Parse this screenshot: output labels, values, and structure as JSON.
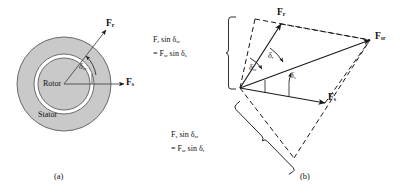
{
  "figure": {
    "type": "engineering-vector-diagram",
    "panels": [
      {
        "id": "a",
        "caption": "(a)",
        "title": "rotor-stator cross section",
        "regions": [
          {
            "name": "stator",
            "label": "Stator",
            "fill": "#c9c9c9"
          },
          {
            "name": "rotor",
            "label": "Rotor",
            "fill": "#c9c9c9"
          },
          {
            "name": "air-gap",
            "label": "",
            "fill": "#ffffff"
          }
        ],
        "vectors": [
          {
            "name": "F_r",
            "base": "F",
            "sub": "r",
            "direction_deg": 52
          },
          {
            "name": "F_s",
            "base": "F",
            "sub": "s",
            "direction_deg": 0
          }
        ],
        "angles": [
          {
            "name": "delta_sr",
            "glyph": "δ",
            "sub": "sr",
            "between": [
              "F_s",
              "F_r"
            ]
          }
        ]
      },
      {
        "id": "b",
        "caption": "(b)",
        "title": "vector parallelogram of mmf waves",
        "vectors": [
          {
            "name": "F_r",
            "base": "F",
            "sub": "r"
          },
          {
            "name": "F_s",
            "base": "F",
            "sub": "s"
          },
          {
            "name": "F_sr",
            "base": "F",
            "sub": "sr"
          }
        ],
        "angles": [
          {
            "name": "delta_sr",
            "glyph": "δ",
            "sub": "sr"
          },
          {
            "name": "delta_r",
            "glyph": "δ",
            "sub": "r"
          },
          {
            "name": "delta_s",
            "glyph": "δ",
            "sub": "s"
          }
        ],
        "equations": [
          {
            "id": "upper",
            "line1": {
              "a": "F",
              "a_sub": "r",
              "mid": " sin ",
              "b": "δ",
              "b_sub": "sr"
            },
            "line2": {
              "eq": "= ",
              "a": "F",
              "a_sub": "sr",
              "mid": " sin ",
              "b": "δ",
              "b_sub": "s"
            },
            "plain": "F_r sin δ_sr = F_sr sin δ_s"
          },
          {
            "id": "lower",
            "line1": {
              "a": "F",
              "a_sub": "s",
              "mid": " sin ",
              "b": "δ",
              "b_sub": "sr"
            },
            "line2": {
              "eq": "= ",
              "a": "F",
              "a_sub": "sr",
              "mid": " sin ",
              "b": "δ",
              "b_sub": "r"
            },
            "plain": "F_s sin δ_sr = F_sr sin δ_r"
          }
        ]
      }
    ],
    "colors": {
      "line": "#1a1a1a",
      "fill_gray": "#c9c9c9",
      "outline_gray": "#6f6f6f",
      "background": "#ffffff"
    }
  }
}
